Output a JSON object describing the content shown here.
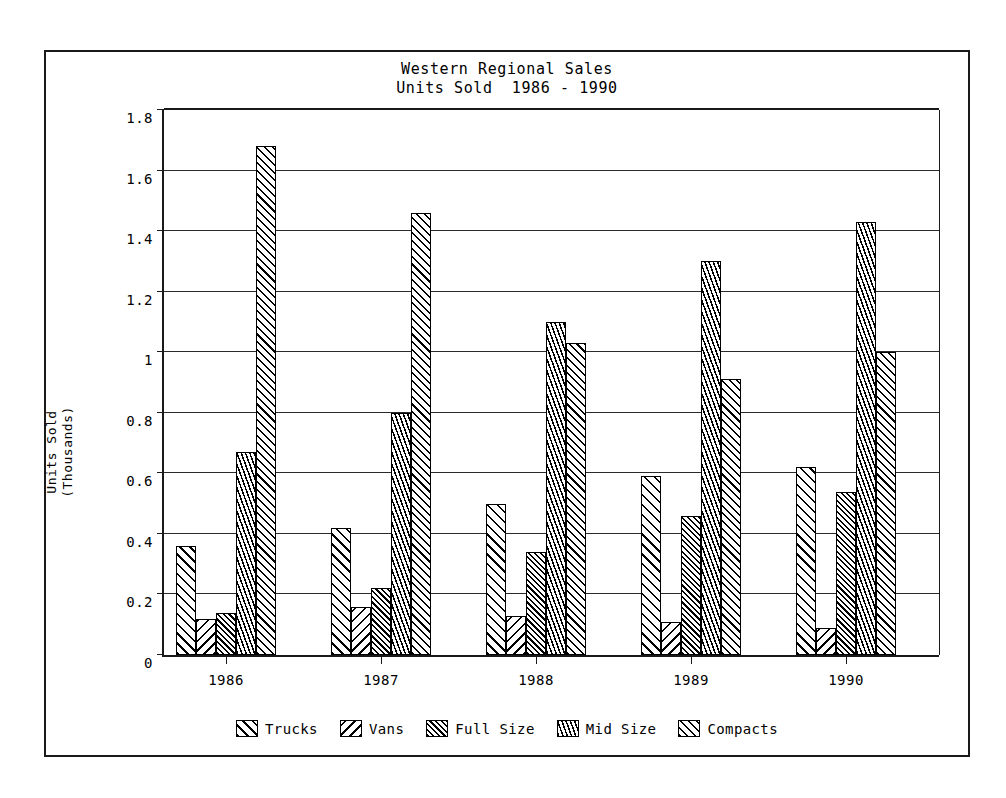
{
  "chart_data": {
    "type": "bar",
    "title": "Western Regional Sales",
    "subtitle": "Units Sold  1986 - 1990",
    "xlabel": "",
    "ylabel": "Units Sold\n(Thousands)",
    "ylabel_line1": "Units Sold",
    "ylabel_line2": "(Thousands)",
    "categories": [
      "1986",
      "1987",
      "1988",
      "1989",
      "1990"
    ],
    "ylim": [
      0,
      1.8
    ],
    "yticks": [
      0,
      0.2,
      0.4,
      0.6,
      0.8,
      1,
      1.2,
      1.4,
      1.6,
      1.8
    ],
    "ytick_labels": [
      "0",
      "0.2",
      "0.4",
      "0.6",
      "0.8",
      "1",
      "1.2",
      "1.4",
      "1.6",
      "1.8"
    ],
    "grid": true,
    "grid_axis": "y",
    "legend_position": "bottom",
    "series": [
      {
        "name": "Trucks",
        "pattern": "diagonal-hatch-up-wide",
        "values": [
          0.36,
          0.42,
          0.5,
          0.59,
          0.62
        ]
      },
      {
        "name": "Vans",
        "pattern": "diagonal-hatch-down-wide",
        "values": [
          0.12,
          0.16,
          0.13,
          0.11,
          0.09
        ]
      },
      {
        "name": "Full Size",
        "pattern": "diagonal-hatch-up-dense",
        "values": [
          0.14,
          0.22,
          0.34,
          0.46,
          0.54
        ]
      },
      {
        "name": "Mid Size",
        "pattern": "steep-hatch-dense",
        "values": [
          0.67,
          0.8,
          1.1,
          1.3,
          1.43
        ]
      },
      {
        "name": "Compacts",
        "pattern": "cross-hatch",
        "values": [
          1.68,
          1.46,
          1.03,
          0.91,
          1.0
        ]
      }
    ]
  },
  "legend": {
    "items": [
      {
        "label": "Trucks",
        "icon": "hatch-swatch-icon"
      },
      {
        "label": "Vans",
        "icon": "hatch-swatch-icon"
      },
      {
        "label": "Full Size",
        "icon": "hatch-swatch-icon"
      },
      {
        "label": "Mid Size",
        "icon": "hatch-swatch-icon"
      },
      {
        "label": "Compacts",
        "icon": "hatch-swatch-icon"
      }
    ]
  },
  "colors": {
    "ink": "#000000",
    "frame": "#1a1a1a",
    "grid": "#2a2a2a",
    "background": "#ffffff"
  }
}
